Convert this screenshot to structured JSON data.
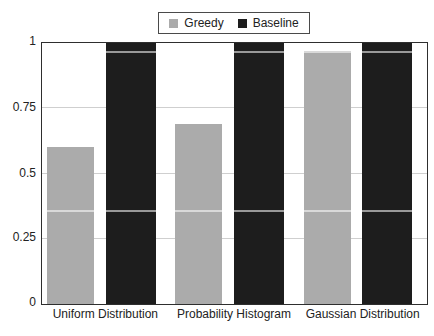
{
  "chart_data": {
    "type": "bar",
    "title": "",
    "xlabel": "",
    "ylabel": "",
    "categories": [
      "Uniform Distribution",
      "Probability Histogram",
      "Gaussian Distribution"
    ],
    "series": [
      {
        "name": "Greedy",
        "color": "#ababab",
        "values": [
          0.6,
          0.69,
          0.97
        ]
      },
      {
        "name": "Baseline",
        "color": "#1d1d1d",
        "values": [
          1.0,
          1.0,
          1.0
        ]
      }
    ],
    "ylim": [
      0,
      1
    ],
    "yticks": [
      "0",
      "0.25",
      "0.5",
      "0.75",
      "1"
    ],
    "ytick_values": [
      0,
      0.25,
      0.5,
      0.75,
      1
    ],
    "grid": "horizontal",
    "legend_position": "top-center",
    "overlay_lines": [
      0.352,
      0.96
    ]
  },
  "legend": {
    "items": [
      {
        "label": "Greedy",
        "color": "#ababab"
      },
      {
        "label": "Baseline",
        "color": "#1d1d1d"
      }
    ]
  },
  "colors": {
    "background": "#ffffff",
    "plot_border": "#2e2e2e",
    "gridline": "#cfcfcf",
    "text": "#222222"
  }
}
